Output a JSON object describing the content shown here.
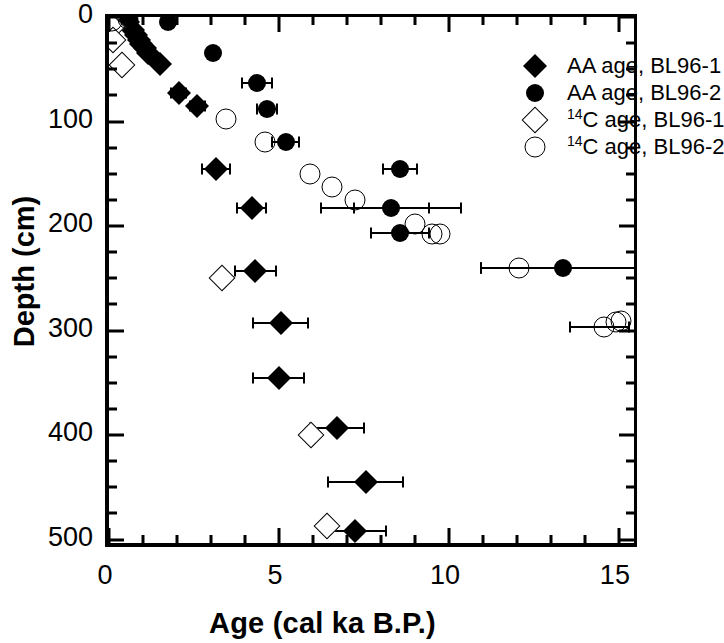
{
  "chart_data": {
    "type": "scatter",
    "title": "",
    "xlabel": "Age (cal ka B.P.)",
    "ylabel": "Depth (cm)",
    "xlim": [
      0,
      15.65
    ],
    "ylim": [
      0,
      510
    ],
    "y_inverted": true,
    "grid": false,
    "x_ticks": [
      0,
      5,
      10,
      15
    ],
    "x_tick_labels": [
      "0",
      "5",
      "10",
      "15"
    ],
    "x_minor_step": 1,
    "y_ticks": [
      0,
      100,
      200,
      300,
      400,
      500
    ],
    "y_tick_labels": [
      "0",
      "100",
      "200",
      "300",
      "400",
      "500"
    ],
    "y_minor_step": 25,
    "legend_position": "top-right",
    "series": [
      {
        "name": "AA age, BL96-1",
        "marker": "filled-diamond",
        "color": "#000000",
        "points": [
          {
            "x": 0.55,
            "y": 5,
            "xerr": 0.0
          },
          {
            "x": 0.72,
            "y": 12,
            "xerr": 0.0
          },
          {
            "x": 0.8,
            "y": 17,
            "xerr": 0.0
          },
          {
            "x": 0.88,
            "y": 22,
            "xerr": 0.0
          },
          {
            "x": 0.95,
            "y": 26,
            "xerr": 0.0
          },
          {
            "x": 1.05,
            "y": 30,
            "xerr": 0.0
          },
          {
            "x": 1.15,
            "y": 34,
            "xerr": 0.0
          },
          {
            "x": 1.5,
            "y": 45,
            "xerr": 0.0
          },
          {
            "x": 2.05,
            "y": 73,
            "xerr": 0.22
          },
          {
            "x": 2.6,
            "y": 85,
            "xerr": 0.22
          },
          {
            "x": 3.15,
            "y": 145,
            "xerr": 0.4
          },
          {
            "x": 4.2,
            "y": 183,
            "xerr": 0.42
          },
          {
            "x": 4.3,
            "y": 243,
            "xerr": 0.6
          },
          {
            "x": 5.05,
            "y": 293,
            "xerr": 0.8
          },
          {
            "x": 5.0,
            "y": 345,
            "xerr": 0.75
          },
          {
            "x": 6.7,
            "y": 393,
            "xerr": 0.8
          },
          {
            "x": 7.55,
            "y": 445,
            "xerr": 1.1
          },
          {
            "x": 7.25,
            "y": 492,
            "xerr": 0.9
          }
        ]
      },
      {
        "name": "AA age, BL96-2",
        "marker": "filled-circle",
        "color": "#000000",
        "points": [
          {
            "x": 0.6,
            "y": 3,
            "xerr": 0.0
          },
          {
            "x": 1.75,
            "y": 5,
            "xerr": 0.0
          },
          {
            "x": 3.05,
            "y": 34,
            "xerr": 0.0
          },
          {
            "x": 4.35,
            "y": 63,
            "xerr": 0.45
          },
          {
            "x": 4.65,
            "y": 88,
            "xerr": 0.3
          },
          {
            "x": 5.2,
            "y": 120,
            "xerr": 0.4
          },
          {
            "x": 8.55,
            "y": 145,
            "xerr": 0.5
          },
          {
            "x": 8.3,
            "y": 183,
            "xerr": 1.1
          },
          {
            "x": 8.55,
            "y": 207,
            "xerr": 0.85
          },
          {
            "x": 13.35,
            "y": 240,
            "xerr": 2.4
          }
        ]
      },
      {
        "name": "14C age, BL96-1",
        "marker": "open-diamond",
        "color": "#000000",
        "points": [
          {
            "x": 0.1,
            "y": 10,
            "xerr": 0.0
          },
          {
            "x": 0.12,
            "y": 22,
            "xerr": 0.0
          },
          {
            "x": 0.38,
            "y": 46,
            "xerr": 0.0
          },
          {
            "x": 3.32,
            "y": 250,
            "xerr": 0.0
          },
          {
            "x": 5.95,
            "y": 400,
            "xerr": 0.0
          },
          {
            "x": 6.4,
            "y": 487,
            "xerr": 0.0
          }
        ]
      },
      {
        "name": "14C age, BL96-2",
        "marker": "open-circle",
        "color": "#000000",
        "points": [
          {
            "x": 0.1,
            "y": 4,
            "xerr": 0.0
          },
          {
            "x": 0.55,
            "y": 2,
            "xerr": 0.0
          },
          {
            "x": 3.45,
            "y": 98,
            "xerr": 0.0
          },
          {
            "x": 4.6,
            "y": 120,
            "xerr": 0.0
          },
          {
            "x": 5.9,
            "y": 150,
            "xerr": 0.0
          },
          {
            "x": 6.55,
            "y": 163,
            "xerr": 0.0
          },
          {
            "x": 7.25,
            "y": 175,
            "xerr": 0.0
          },
          {
            "x": 9.0,
            "y": 198,
            "xerr": 0.0
          },
          {
            "x": 9.5,
            "y": 208,
            "xerr": 0.0
          },
          {
            "x": 9.75,
            "y": 208,
            "xerr": 0.0
          },
          {
            "x": 12.05,
            "y": 240,
            "xerr": 0.0
          },
          {
            "x": 14.55,
            "y": 297,
            "xerr": 0.0
          },
          {
            "x": 14.9,
            "y": 292,
            "xerr": 0.0
          },
          {
            "x": 15.05,
            "y": 291,
            "xerr": 0.0
          }
        ]
      }
    ],
    "error_bar_ranges": [
      {
        "series": "AA age, BL96-2",
        "x": 8.3,
        "y": 183,
        "xmin": 6.25,
        "xmax": 10.35
      },
      {
        "series": "AA age, BL96-2",
        "x": 13.35,
        "y": 240,
        "xmin": 10.95,
        "xmax": 15.65
      },
      {
        "series": "14C age, BL96-2",
        "x": 12.05,
        "y": 240,
        "xmin": 10.95,
        "xmax": 15.65
      },
      {
        "series": "14C age, BL96-2",
        "x": 14.55,
        "y": 297,
        "xmin": 13.55,
        "xmax": 15.3
      }
    ]
  },
  "legend": {
    "items": [
      {
        "label": "AA age, BL96-1",
        "marker": "filled-diamond",
        "sup": "",
        "text": "AA age, BL96-1"
      },
      {
        "label": "AA age, BL96-2",
        "marker": "filled-circle",
        "sup": "",
        "text": "AA age, BL96-2"
      },
      {
        "label": "14C age, BL96-1",
        "marker": "open-diamond",
        "sup": "14",
        "text": "C age, BL96-1"
      },
      {
        "label": "14C age, BL96-2",
        "marker": "open-circle",
        "sup": "14",
        "text": "C age, BL96-2"
      }
    ]
  },
  "axes": {
    "x_title": "Age (cal ka B.P.)",
    "y_title": "Depth (cm)"
  }
}
